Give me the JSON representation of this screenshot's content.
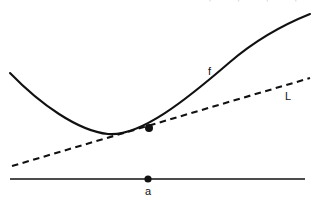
{
  "figure": {
    "title": "",
    "background_color": "#ffffff",
    "stroke_color": "#111111",
    "width": 318,
    "height": 205,
    "clipped_top_text": "¬ ¬ ¬ ¬"
  },
  "labels": {
    "curve": "f",
    "tangent_line": "L",
    "axis_point": "a"
  },
  "chart_data": {
    "type": "line",
    "title": "",
    "subtitle": "",
    "xlabel": "",
    "ylabel": "",
    "grid": false,
    "legend_position": "inline-annotation",
    "axes": {
      "x_axis_visible": true,
      "y_axis_visible": false,
      "x_axis_y_pixel": 179,
      "x_axis_from_x": 10,
      "x_axis_to_x": 305
    },
    "annotations": [
      {
        "name": "curve-label",
        "text": "f",
        "x": 212,
        "y": 72
      },
      {
        "name": "tangent-label",
        "text": "L",
        "x": 288,
        "y": 97
      },
      {
        "name": "axis-point-label",
        "text": "a",
        "x": 148,
        "y": 192
      }
    ],
    "points": [
      {
        "name": "tangency-point",
        "x": 149,
        "y": 128,
        "style": "filled-dot"
      },
      {
        "name": "axis-point-a",
        "x": 148,
        "y": 179,
        "style": "filled-dot"
      }
    ],
    "series": [
      {
        "name": "f",
        "style": "solid",
        "description": "convex curve with minimum left of the tangency point",
        "path": "M 10,73 C 40,104 78,131 108,134 C 140,137 186,100 230,62 C 258,38 290,22 310,14"
      },
      {
        "name": "L",
        "style": "dashed",
        "description": "tangent line to f at x = a",
        "path": "M 12,166 L 310,78"
      },
      {
        "name": "x-axis",
        "style": "solid",
        "description": "horizontal number line",
        "path": "M 10,179 L 305,179"
      }
    ]
  }
}
